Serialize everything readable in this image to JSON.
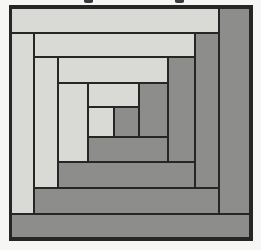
{
  "figure": {
    "kind": "log-cabin-quilt-block",
    "colors": {
      "page_background": "#f6f6f5",
      "light_fabric": "#d9d9d6",
      "dark_fabric": "#8d8d8b",
      "seam_line": "#262626",
      "text_fragment": "#3a3a3a"
    },
    "frame": {
      "x": 9,
      "y": 5,
      "w": 244,
      "h": 236
    },
    "pieces": [
      {
        "name": "top-strip-1",
        "shade": "light",
        "x": 11,
        "y": 8,
        "x2": 219,
        "y2": 33
      },
      {
        "name": "right-strip-1",
        "shade": "dark",
        "x": 219,
        "y": 8,
        "x2": 250,
        "y2": 214
      },
      {
        "name": "left-strip-1",
        "shade": "light",
        "x": 11,
        "y": 33,
        "x2": 34,
        "y2": 214
      },
      {
        "name": "bottom-strip-1",
        "shade": "dark",
        "x": 11,
        "y": 214,
        "x2": 250,
        "y2": 238
      },
      {
        "name": "top-strip-2",
        "shade": "light",
        "x": 34,
        "y": 33,
        "x2": 195,
        "y2": 57
      },
      {
        "name": "right-strip-2",
        "shade": "dark",
        "x": 195,
        "y": 33,
        "x2": 219,
        "y2": 188
      },
      {
        "name": "left-strip-2",
        "shade": "light",
        "x": 34,
        "y": 57,
        "x2": 58,
        "y2": 188
      },
      {
        "name": "bottom-strip-2",
        "shade": "dark",
        "x": 34,
        "y": 188,
        "x2": 219,
        "y2": 214
      },
      {
        "name": "top-strip-3",
        "shade": "light",
        "x": 58,
        "y": 57,
        "x2": 168,
        "y2": 83
      },
      {
        "name": "right-strip-3",
        "shade": "dark",
        "x": 168,
        "y": 57,
        "x2": 195,
        "y2": 162
      },
      {
        "name": "left-strip-3",
        "shade": "light",
        "x": 58,
        "y": 83,
        "x2": 88,
        "y2": 162
      },
      {
        "name": "bottom-strip-3",
        "shade": "dark",
        "x": 58,
        "y": 162,
        "x2": 195,
        "y2": 188
      },
      {
        "name": "top-strip-4",
        "shade": "light",
        "x": 88,
        "y": 83,
        "x2": 139,
        "y2": 107
      },
      {
        "name": "right-strip-4",
        "shade": "dark",
        "x": 139,
        "y": 83,
        "x2": 168,
        "y2": 137
      },
      {
        "name": "left-square-4",
        "shade": "light",
        "x": 88,
        "y": 107,
        "x2": 114,
        "y2": 137
      },
      {
        "name": "bottom-strip-4",
        "shade": "dark",
        "x": 88,
        "y": 137,
        "x2": 168,
        "y2": 162
      },
      {
        "name": "center-square",
        "shade": "dark",
        "x": 114,
        "y": 107,
        "x2": 139,
        "y2": 137
      }
    ],
    "cropped_text_fragments": [
      {
        "name": "descender-fragment-left",
        "x": 84,
        "y": 0,
        "w": 9,
        "h": 3
      },
      {
        "name": "descender-fragment-right",
        "x": 175,
        "y": 0,
        "w": 9,
        "h": 3
      }
    ]
  }
}
